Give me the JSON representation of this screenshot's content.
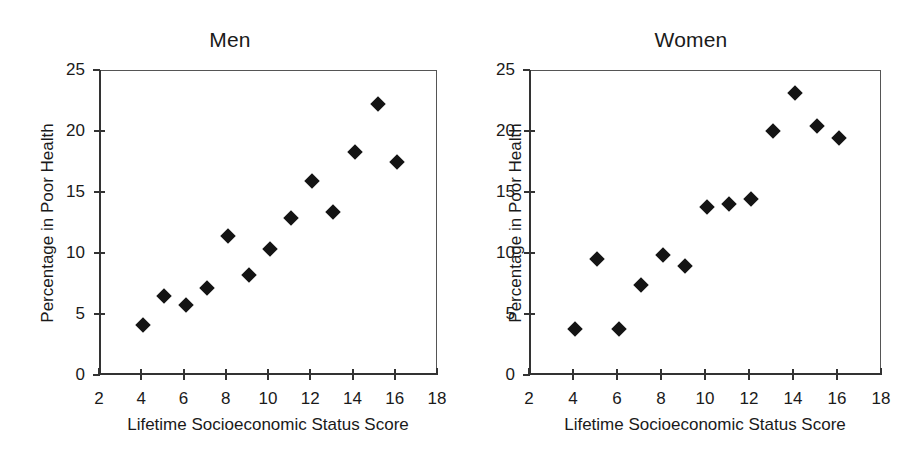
{
  "figure": {
    "background": "#ffffff",
    "marker_color": "#141414",
    "axis_color": "#333333"
  },
  "chart_data": [
    {
      "type": "scatter",
      "title": "Men",
      "xlabel": "Lifetime Socioeconomic Status Score",
      "ylabel": "Percentage in Poor Health",
      "xlim": [
        2,
        18
      ],
      "ylim": [
        0,
        25
      ],
      "xticks": [
        2,
        4,
        6,
        8,
        10,
        12,
        14,
        16,
        18
      ],
      "yticks": [
        0,
        5,
        10,
        15,
        20,
        25
      ],
      "xtick_labels": [
        "2",
        "4",
        "6",
        "8",
        "10",
        "12",
        "14",
        "16",
        "18"
      ],
      "ytick_labels": [
        "0",
        "5",
        "10",
        "15",
        "20",
        "25"
      ],
      "grid": false,
      "legend": "none",
      "marker": "diamond",
      "points": [
        {
          "x": 4.1,
          "y": 4.1
        },
        {
          "x": 5.1,
          "y": 6.5
        },
        {
          "x": 6.1,
          "y": 5.7
        },
        {
          "x": 7.1,
          "y": 7.1
        },
        {
          "x": 8.1,
          "y": 11.4
        },
        {
          "x": 9.1,
          "y": 8.2
        },
        {
          "x": 10.1,
          "y": 10.3
        },
        {
          "x": 11.1,
          "y": 12.9
        },
        {
          "x": 12.1,
          "y": 15.9
        },
        {
          "x": 13.1,
          "y": 13.4
        },
        {
          "x": 14.1,
          "y": 18.3
        },
        {
          "x": 15.2,
          "y": 22.2
        },
        {
          "x": 16.1,
          "y": 17.5
        }
      ]
    },
    {
      "type": "scatter",
      "title": "Women",
      "xlabel": "Lifetime Socioeconomic Status Score",
      "ylabel": "Percentage in Poor Health",
      "xlim": [
        2,
        18
      ],
      "ylim": [
        0,
        25
      ],
      "xticks": [
        2,
        4,
        6,
        8,
        10,
        12,
        14,
        16,
        18
      ],
      "yticks": [
        0,
        5,
        10,
        15,
        20,
        25
      ],
      "xtick_labels": [
        "2",
        "4",
        "6",
        "8",
        "10",
        "12",
        "14",
        "16",
        "18"
      ],
      "ytick_labels": [
        "0",
        "5",
        "10",
        "15",
        "20",
        "25"
      ],
      "grid": false,
      "legend": "none",
      "marker": "diamond",
      "points": [
        {
          "x": 4.1,
          "y": 3.8
        },
        {
          "x": 5.1,
          "y": 9.5
        },
        {
          "x": 6.1,
          "y": 3.8
        },
        {
          "x": 7.1,
          "y": 7.4
        },
        {
          "x": 8.1,
          "y": 9.8
        },
        {
          "x": 9.1,
          "y": 8.9
        },
        {
          "x": 10.1,
          "y": 13.8
        },
        {
          "x": 11.1,
          "y": 14.0
        },
        {
          "x": 12.1,
          "y": 14.4
        },
        {
          "x": 13.1,
          "y": 20.0
        },
        {
          "x": 14.1,
          "y": 23.1
        },
        {
          "x": 15.1,
          "y": 20.4
        },
        {
          "x": 16.1,
          "y": 19.4
        }
      ]
    }
  ]
}
